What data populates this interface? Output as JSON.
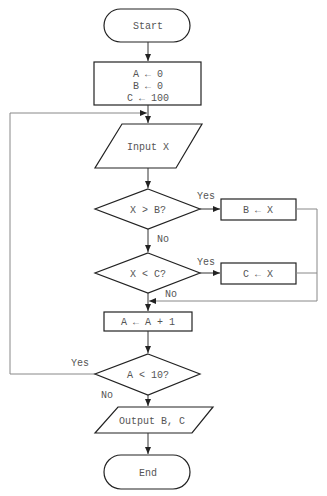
{
  "diagram": {
    "type": "flowchart",
    "nodes": {
      "start": {
        "label": "Start",
        "shape": "terminator"
      },
      "init": {
        "lines": [
          "A ← 0",
          "B ← 0",
          "C ← 100"
        ],
        "shape": "process"
      },
      "input": {
        "label": "Input X",
        "shape": "io"
      },
      "cond_b": {
        "label": "X > B?",
        "shape": "decision"
      },
      "set_b": {
        "label": "B ← X",
        "shape": "process"
      },
      "cond_c": {
        "label": "X < C?",
        "shape": "decision"
      },
      "set_c": {
        "label": "C ← X",
        "shape": "process"
      },
      "inc_a": {
        "label": "A ← A + 1",
        "shape": "process"
      },
      "cond_a": {
        "label": "A < 10?",
        "shape": "decision"
      },
      "output": {
        "label": "Output B, C",
        "shape": "io"
      },
      "end": {
        "label": "End",
        "shape": "terminator"
      }
    },
    "edge_labels": {
      "cond_b_yes": "Yes",
      "cond_b_no": "No",
      "cond_c_yes": "Yes",
      "cond_c_no": "No",
      "cond_a_yes": "Yes",
      "cond_a_no": "No"
    },
    "edges": [
      {
        "from": "start",
        "to": "init"
      },
      {
        "from": "init",
        "to": "input"
      },
      {
        "from": "input",
        "to": "cond_b"
      },
      {
        "from": "cond_b",
        "to": "set_b",
        "label": "Yes"
      },
      {
        "from": "cond_b",
        "to": "cond_c",
        "label": "No"
      },
      {
        "from": "set_b",
        "to": "inc_a"
      },
      {
        "from": "cond_c",
        "to": "set_c",
        "label": "Yes"
      },
      {
        "from": "cond_c",
        "to": "inc_a",
        "label": "No"
      },
      {
        "from": "set_c",
        "to": "inc_a"
      },
      {
        "from": "inc_a",
        "to": "cond_a"
      },
      {
        "from": "cond_a",
        "to": "input",
        "label": "Yes"
      },
      {
        "from": "cond_a",
        "to": "output",
        "label": "No"
      },
      {
        "from": "output",
        "to": "end"
      }
    ]
  }
}
